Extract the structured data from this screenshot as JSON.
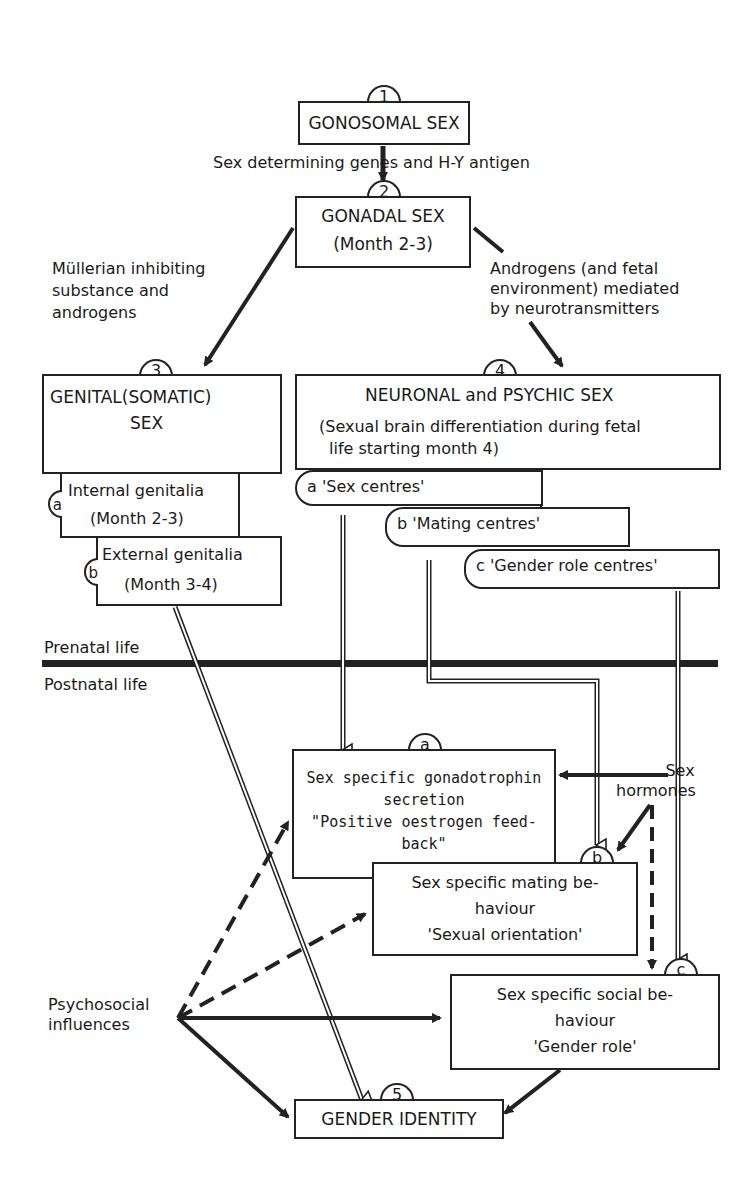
{
  "nodes": {
    "n1": {
      "number": "1",
      "title": "GONOSOMAL SEX"
    },
    "n2": {
      "number": "2",
      "title": "GONADAL SEX",
      "subtitle": "(Month 2-3)"
    },
    "n3": {
      "number": "3",
      "title": "GENITAL(SOMATIC)",
      "title2": "SEX",
      "sub_a": {
        "letter": "a",
        "line1": "Internal genitalia",
        "line2": "(Month 2-3)"
      },
      "sub_b": {
        "letter": "b",
        "line1": "External genitalia",
        "line2": "(Month 3-4)"
      }
    },
    "n4": {
      "number": "4",
      "title": "NEURONAL and PSYCHIC SEX",
      "line1": "(Sexual brain differentiation during fetal",
      "line2": "life starting month 4)",
      "sub_a": "a  'Sex centres'",
      "sub_b": "b  'Mating centres'",
      "sub_c": "c   'Gender role centres'"
    },
    "na": {
      "letter": "a",
      "line1": "Sex specific gonadotrophin",
      "line2": "secretion",
      "line3": "\"Positive oestrogen feed-",
      "line4": "back\""
    },
    "nb": {
      "letter": "b",
      "line1": "Sex specific mating be-",
      "line2": "haviour",
      "line3": "'Sexual orientation'"
    },
    "nc": {
      "letter": "c",
      "line1": "Sex specific social  be-",
      "line2": "haviour",
      "line3": "'Gender role'"
    },
    "n5": {
      "number": "5",
      "title": "GENDER IDENTITY"
    }
  },
  "edge_labels": {
    "genes": "Sex determining genes and H-Y antigen",
    "mullerian": [
      "Müllerian inhibiting",
      "substance and",
      "androgens"
    ],
    "androgens": [
      "Androgens  (and fetal",
      "environment) mediated",
      "by neurotransmitters"
    ],
    "hormones": [
      "Sex",
      "hormones"
    ],
    "psychosocial": [
      "Psychosocial",
      "influences"
    ]
  },
  "divider": {
    "above": "Prenatal life",
    "below": "Postnatal life"
  }
}
